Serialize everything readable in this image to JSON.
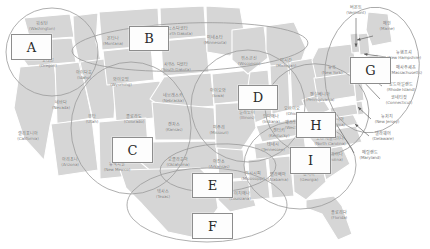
{
  "figure": {
    "map_fill": "#d6d6d6",
    "map_stroke": "#ffffff",
    "ellipse_stroke": "#9a9a9a",
    "box_border": "#8d8d8d",
    "label_color": "#6e6e6e"
  },
  "state_labels": [
    {
      "ko": "워싱턴",
      "en": "(Washington)",
      "x": 42,
      "y": 27
    },
    {
      "ko": "오레곤",
      "en": "(Oregon)",
      "x": 48,
      "y": 64
    },
    {
      "ko": "아이다호",
      "en": "(Idaho)",
      "x": 84,
      "y": 76
    },
    {
      "ko": "몬타나",
      "en": "(Montana)",
      "x": 113,
      "y": 42
    },
    {
      "ko": "노스다코타",
      "en": "(North Dakota)",
      "x": 178,
      "y": 32
    },
    {
      "ko": "미네소타",
      "en": "(Minnesota)",
      "x": 215,
      "y": 41
    },
    {
      "ko": "위스콘신",
      "en": "(Wisconsin)",
      "x": 249,
      "y": 62
    },
    {
      "ko": "미시간",
      "en": "(Michigan)",
      "x": 286,
      "y": 64
    },
    {
      "ko": "사우스 다코타",
      "en": "(South Dakota)",
      "x": 176,
      "y": 68
    },
    {
      "ko": "와이오밍",
      "en": "(Wyoming)",
      "x": 121,
      "y": 83
    },
    {
      "ko": "네브래스카",
      "en": "(Nebraska)",
      "x": 173,
      "y": 99
    },
    {
      "ko": "아이오와",
      "en": "(Iowa)",
      "x": 218,
      "y": 94
    },
    {
      "ko": "네바다",
      "en": "(Nevada)",
      "x": 61,
      "y": 106
    },
    {
      "ko": "유타",
      "en": "(Utah)",
      "x": 92,
      "y": 120
    },
    {
      "ko": "콜로라도",
      "en": "(Colorado)",
      "x": 134,
      "y": 120
    },
    {
      "ko": "캔자스",
      "en": "(Kansas)",
      "x": 174,
      "y": 128
    },
    {
      "ko": "미주리",
      "en": "(Missouri)",
      "x": 219,
      "y": 131
    },
    {
      "ko": "일리노이",
      "en": "(Illinois)",
      "x": 247,
      "y": 116
    },
    {
      "ko": "인디애나",
      "en": "(Indiana)",
      "x": 271,
      "y": 120
    },
    {
      "ko": "오하이오",
      "en": "(Ohio)",
      "x": 292,
      "y": 112
    },
    {
      "ko": "캘리포니아",
      "en": "(California)",
      "x": 28,
      "y": 137
    },
    {
      "ko": "아리조나",
      "en": "(Arizona)",
      "x": 70,
      "y": 163
    },
    {
      "ko": "뉴멕시코",
      "en": "(New Mexico)",
      "x": 117,
      "y": 168
    },
    {
      "ko": "오클라호마",
      "en": "(Oklahoma)",
      "x": 178,
      "y": 163
    },
    {
      "ko": "아칸소",
      "en": "(Arkansas)",
      "x": 219,
      "y": 165
    },
    {
      "ko": "켄터키",
      "en": "(Kentucky)",
      "x": 279,
      "y": 134
    },
    {
      "ko": "테네시",
      "en": "(Tennessee)",
      "x": 273,
      "y": 148
    },
    {
      "ko": "웨스트버지니아",
      "en": "(West Virginia)",
      "x": 299,
      "y": 126
    },
    {
      "ko": "버지니아",
      "en": "(Virginia)",
      "x": 336,
      "y": 123
    },
    {
      "ko": "노스 캐롤라이나",
      "en": "(North Carolina)",
      "x": 330,
      "y": 142
    },
    {
      "ko": "사우스 캐롤라이나",
      "en": "(South Carolina)",
      "x": 327,
      "y": 158
    },
    {
      "ko": "조지아",
      "en": "(Georgia)",
      "x": 309,
      "y": 178
    },
    {
      "ko": "앨라배마",
      "en": "(Alabama)",
      "x": 278,
      "y": 178
    },
    {
      "ko": "미시시피",
      "en": "(Mississippi)",
      "x": 253,
      "y": 177
    },
    {
      "ko": "루이지애나",
      "en": "(Louisiana)",
      "x": 240,
      "y": 197
    },
    {
      "ko": "텍사스",
      "en": "(Texas)",
      "x": 163,
      "y": 195
    },
    {
      "ko": "플로리다",
      "en": "(Florida)",
      "x": 339,
      "y": 216
    },
    {
      "ko": "뉴욕",
      "en": "(New York)",
      "x": 332,
      "y": 71
    },
    {
      "ko": "펜실베니아",
      "en": "(Pennsylvania)",
      "x": 320,
      "y": 98
    },
    {
      "ko": "버몬트",
      "en": "(Vermont)",
      "x": 356,
      "y": 11
    },
    {
      "ko": "메인",
      "en": "(Maine)",
      "x": 387,
      "y": 27
    },
    {
      "ko": "뉴햄프셔",
      "en": "(New Hampshire)",
      "x": 404,
      "y": 56
    },
    {
      "ko": "매사추세츠",
      "en": "(Massachusetts)",
      "x": 406,
      "y": 71
    },
    {
      "ko": "로드아일랜드",
      "en": "(Rhode Island)",
      "x": 401,
      "y": 88
    },
    {
      "ko": "코네티컷",
      "en": "(Connecticut)",
      "x": 399,
      "y": 101
    },
    {
      "ko": "뉴저지",
      "en": "(New Jersey)",
      "x": 387,
      "y": 120
    },
    {
      "ko": "델라웨어",
      "en": "(Delaware)",
      "x": 383,
      "y": 137
    },
    {
      "ko": "메릴랜드",
      "en": "(Maryland)",
      "x": 370,
      "y": 156
    }
  ],
  "region_boxes": [
    {
      "label": "A",
      "x": 11,
      "y": 34,
      "w": 39,
      "h": 24
    },
    {
      "label": "B",
      "x": 129,
      "y": 26,
      "w": 38,
      "h": 23
    },
    {
      "label": "C",
      "x": 112,
      "y": 137,
      "w": 39,
      "h": 24
    },
    {
      "label": "D",
      "x": 238,
      "y": 85,
      "w": 38,
      "h": 23
    },
    {
      "label": "E",
      "x": 192,
      "y": 173,
      "w": 39,
      "h": 23
    },
    {
      "label": "F",
      "x": 192,
      "y": 213,
      "w": 39,
      "h": 24
    },
    {
      "label": "G",
      "x": 350,
      "y": 57,
      "w": 39,
      "h": 25
    },
    {
      "label": "H",
      "x": 296,
      "y": 112,
      "w": 38,
      "h": 24
    },
    {
      "label": "I",
      "x": 290,
      "y": 147,
      "w": 39,
      "h": 25
    }
  ],
  "region_ellipses": [
    {
      "name": "pacific-northwest-ellipse",
      "cx": 52,
      "cy": 52,
      "rx": 46,
      "ry": 44,
      "rot": 0
    },
    {
      "name": "northern-plains-ellipse",
      "cx": 190,
      "cy": 47,
      "rx": 118,
      "ry": 24,
      "rot": -2
    },
    {
      "name": "mountain-west-ellipse",
      "cx": 131,
      "cy": 128,
      "rx": 60,
      "ry": 66,
      "rot": 0
    },
    {
      "name": "midwest-ellipse",
      "cx": 248,
      "cy": 106,
      "rx": 57,
      "ry": 56,
      "rot": 0
    },
    {
      "name": "south-central-ellipse",
      "cx": 218,
      "cy": 168,
      "rx": 58,
      "ry": 24,
      "rot": -3
    },
    {
      "name": "texas-ellipse",
      "cx": 207,
      "cy": 205,
      "rx": 80,
      "ry": 37,
      "rot": 0
    },
    {
      "name": "northeast-ellipse",
      "cx": 372,
      "cy": 70,
      "rx": 47,
      "ry": 63,
      "rot": 7
    },
    {
      "name": "mid-atlantic-ellipse",
      "cx": 317,
      "cy": 110,
      "rx": 52,
      "ry": 46,
      "rot": 10
    },
    {
      "name": "southeast-ellipse",
      "cx": 300,
      "cy": 165,
      "rx": 56,
      "ry": 44,
      "rot": 0
    }
  ],
  "leader_lines": [
    {
      "name": "vermont-leader",
      "x1": 356,
      "y1": 18,
      "x2": 356,
      "y2": 47
    },
    {
      "name": "maine-leader",
      "x1": 373,
      "y1": 36,
      "x2": 357,
      "y2": 40
    },
    {
      "name": "new-hampshire-leader",
      "x1": 386,
      "y1": 57,
      "x2": 364,
      "y2": 54
    },
    {
      "name": "massachusetts-leader",
      "x1": 386,
      "y1": 70,
      "x2": 370,
      "y2": 70
    },
    {
      "name": "rhode-island-leader",
      "x1": 382,
      "y1": 86,
      "x2": 368,
      "y2": 76
    },
    {
      "name": "connecticut-leader",
      "x1": 380,
      "y1": 99,
      "x2": 361,
      "y2": 79
    },
    {
      "name": "new-jersey-leader",
      "x1": 371,
      "y1": 119,
      "x2": 358,
      "y2": 107
    },
    {
      "name": "delaware-leader",
      "x1": 369,
      "y1": 136,
      "x2": 355,
      "y2": 124
    },
    {
      "name": "maryland-leader",
      "x1": 354,
      "y1": 153,
      "x2": 332,
      "y2": 117
    }
  ]
}
